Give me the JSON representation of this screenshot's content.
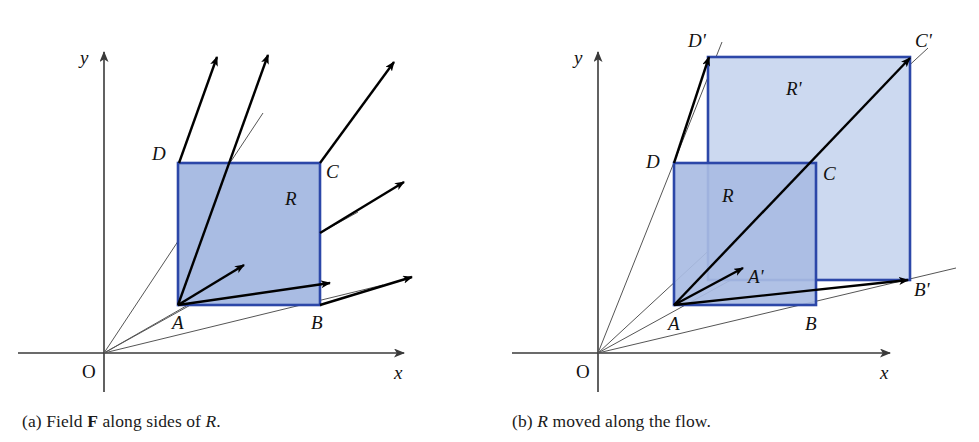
{
  "figure": {
    "width": 979,
    "height": 442,
    "background": "#ffffff",
    "colors": {
      "region_fill_dark": "#a9bce3",
      "region_fill_light": "#ccd9f0",
      "region_stroke": "#2c47a8",
      "axis": "#3a3a3a",
      "field_arrow": "#000000",
      "flow_line": "#555555",
      "text": "#111111"
    }
  },
  "panel_a": {
    "caption_prefix": "(a) Field",
    "caption_bold": "F",
    "caption_mid": "along sides of",
    "caption_italic": "R",
    "caption_suffix": ".",
    "axes": {
      "x_label": "x",
      "y_label": "y",
      "origin_label": "O"
    },
    "region_label": "R",
    "vertices": [
      {
        "name": "A",
        "label": "A"
      },
      {
        "name": "B",
        "label": "B"
      },
      {
        "name": "C",
        "label": "C"
      },
      {
        "name": "D",
        "label": "D"
      }
    ]
  },
  "panel_b": {
    "caption_prefix": "(b)",
    "caption_italic": "R",
    "caption_suffix": "moved along the flow.",
    "axes": {
      "x_label": "x",
      "y_label": "y",
      "origin_label": "O"
    },
    "region_label": "R",
    "region_moved_label": "R'",
    "vertices": [
      {
        "name": "A",
        "label": "A"
      },
      {
        "name": "B",
        "label": "B"
      },
      {
        "name": "C",
        "label": "C"
      },
      {
        "name": "D",
        "label": "D"
      },
      {
        "name": "A-prime",
        "label": "A'"
      },
      {
        "name": "B-prime",
        "label": "B'"
      },
      {
        "name": "C-prime",
        "label": "C'"
      },
      {
        "name": "D-prime",
        "label": "D'"
      }
    ]
  }
}
